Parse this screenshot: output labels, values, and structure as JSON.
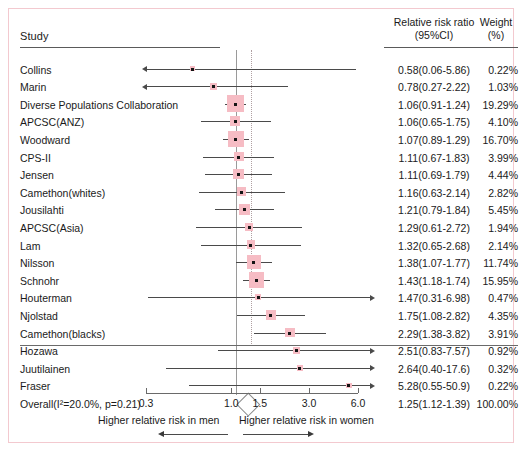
{
  "figure": {
    "type": "forest-plot",
    "columns": {
      "study_header": "Study",
      "effect_header_line1": "Relative risk ratio",
      "effect_header_line2": "(95%CI)",
      "weight_header_line1": "Weight",
      "weight_header_line2": "(%)"
    },
    "axis": {
      "ticks": [
        "0.3",
        "1.0",
        "1.5",
        "3.0",
        "6.0"
      ],
      "tick_values": [
        0.3,
        1.0,
        1.5,
        3.0,
        6.0
      ],
      "caption_left": "Higher relative risk in men",
      "caption_right": "Higher relative risk in women",
      "null_value": 1.0,
      "pooled_line_value": 1.25,
      "scale": "log"
    },
    "colors": {
      "box": "#f6bcc4",
      "frame": "#f3c9cf",
      "line": "#4a4a4a",
      "null_line": "#9a9a9a",
      "pooled_line": "#b0a0a2",
      "text": "#1a1a1a"
    }
  },
  "chart_data": {
    "type": "forest",
    "title": "",
    "xlabel": "Relative risk ratio (95%CI)",
    "ylabel": "Study",
    "xscale": "log",
    "xlim": [
      0.3,
      6.0
    ],
    "xticks": [
      0.3,
      1.0,
      1.5,
      3.0,
      6.0
    ],
    "xticklabels": [
      "0.3",
      "1.0",
      "1.5",
      "3.0",
      "6.0"
    ],
    "null_line": 1.0,
    "pooled_line": 1.25,
    "grid": false,
    "legend": "none",
    "annotations": [
      "Higher relative risk in men",
      "Higher relative risk in women"
    ],
    "columns": [
      "Study",
      "Relative risk ratio (95%CI)",
      "Weight (%)"
    ],
    "rows": [
      {
        "study": "Collins",
        "estimate": 0.58,
        "lower": 0.06,
        "upper": 5.86,
        "effect_text": "0.58(0.06-5.86)",
        "weight": 0.22,
        "weight_text": "0.22%",
        "truncated_left": true,
        "truncated_right": true
      },
      {
        "study": "Marin",
        "estimate": 0.78,
        "lower": 0.27,
        "upper": 2.22,
        "effect_text": "0.78(0.27-2.22)",
        "weight": 1.03,
        "weight_text": "1.03%",
        "truncated_left": true,
        "truncated_right": false
      },
      {
        "study": "Diverse Populations Collaboration",
        "estimate": 1.06,
        "lower": 0.91,
        "upper": 1.24,
        "effect_text": "1.06(0.91-1.24)",
        "weight": 19.29,
        "weight_text": "19.29%",
        "truncated_left": false,
        "truncated_right": false
      },
      {
        "study": "APCSC(ANZ)",
        "estimate": 1.06,
        "lower": 0.65,
        "upper": 1.75,
        "effect_text": "1.06(0.65-1.75)",
        "weight": 4.1,
        "weight_text": "4.10%",
        "truncated_left": false,
        "truncated_right": false
      },
      {
        "study": "Woodward",
        "estimate": 1.07,
        "lower": 0.89,
        "upper": 1.29,
        "effect_text": "1.07(0.89-1.29)",
        "weight": 16.7,
        "weight_text": "16.70%",
        "truncated_left": false,
        "truncated_right": false
      },
      {
        "study": "CPS-II",
        "estimate": 1.11,
        "lower": 0.67,
        "upper": 1.83,
        "effect_text": "1.11(0.67-1.83)",
        "weight": 3.99,
        "weight_text": "3.99%",
        "truncated_left": false,
        "truncated_right": false
      },
      {
        "study": "Jensen",
        "estimate": 1.11,
        "lower": 0.69,
        "upper": 1.79,
        "effect_text": "1.11(0.69-1.79)",
        "weight": 4.44,
        "weight_text": "4.44%",
        "truncated_left": false,
        "truncated_right": false
      },
      {
        "study": "Camethon(whites)",
        "estimate": 1.16,
        "lower": 0.63,
        "upper": 2.14,
        "effect_text": "1.16(0.63-2.14)",
        "weight": 2.82,
        "weight_text": "2.82%",
        "truncated_left": false,
        "truncated_right": false
      },
      {
        "study": "Jousilahti",
        "estimate": 1.21,
        "lower": 0.79,
        "upper": 1.84,
        "effect_text": "1.21(0.79-1.84)",
        "weight": 5.45,
        "weight_text": "5.45%",
        "truncated_left": false,
        "truncated_right": false
      },
      {
        "study": "APCSC(Asia)",
        "estimate": 1.29,
        "lower": 0.61,
        "upper": 2.72,
        "effect_text": "1.29(0.61-2.72)",
        "weight": 1.94,
        "weight_text": "1.94%",
        "truncated_left": false,
        "truncated_right": false
      },
      {
        "study": "Lam",
        "estimate": 1.32,
        "lower": 0.65,
        "upper": 2.68,
        "effect_text": "1.32(0.65-2.68)",
        "weight": 2.14,
        "weight_text": "2.14%",
        "truncated_left": false,
        "truncated_right": false
      },
      {
        "study": "Nilsson",
        "estimate": 1.38,
        "lower": 1.07,
        "upper": 1.77,
        "effect_text": "1.38(1.07-1.77)",
        "weight": 11.74,
        "weight_text": "11.74%",
        "truncated_left": false,
        "truncated_right": false
      },
      {
        "study": "Schnohr",
        "estimate": 1.43,
        "lower": 1.18,
        "upper": 1.74,
        "effect_text": "1.43(1.18-1.74)",
        "weight": 15.95,
        "weight_text": "15.95%",
        "truncated_left": false,
        "truncated_right": false
      },
      {
        "study": "Houterman",
        "estimate": 1.47,
        "lower": 0.31,
        "upper": 6.98,
        "effect_text": "1.47(0.31-6.98)",
        "weight": 0.47,
        "weight_text": "0.47%",
        "truncated_left": false,
        "truncated_right": true
      },
      {
        "study": "Njolstad",
        "estimate": 1.75,
        "lower": 1.08,
        "upper": 2.82,
        "effect_text": "1.75(1.08-2.82)",
        "weight": 4.35,
        "weight_text": "4.35%",
        "truncated_left": false,
        "truncated_right": false
      },
      {
        "study": "Camethon(blacks)",
        "estimate": 2.29,
        "lower": 1.38,
        "upper": 3.82,
        "effect_text": "2.29(1.38-3.82)",
        "weight": 3.91,
        "weight_text": "3.91%",
        "truncated_left": false,
        "truncated_right": false
      },
      {
        "study": "Hozawa",
        "estimate": 2.51,
        "lower": 0.83,
        "upper": 7.57,
        "effect_text": "2.51(0.83-7.57)",
        "weight": 0.92,
        "weight_text": "0.92%",
        "truncated_left": false,
        "truncated_right": true
      },
      {
        "study": "Juutilainen",
        "estimate": 2.64,
        "lower": 0.4,
        "upper": 17.6,
        "effect_text": "2.64(0.40-17.6)",
        "weight": 0.32,
        "weight_text": "0.32%",
        "truncated_left": false,
        "truncated_right": true
      },
      {
        "study": "Fraser",
        "estimate": 5.28,
        "lower": 0.55,
        "upper": 50.9,
        "effect_text": "5.28(0.55-50.9)",
        "weight": 0.22,
        "weight_text": "0.22%",
        "truncated_left": false,
        "truncated_right": true
      }
    ],
    "overall": {
      "study": "Overall(I²=20.0%, p=0.21)",
      "estimate": 1.25,
      "lower": 1.12,
      "upper": 1.39,
      "effect_text": "1.25(1.12-1.39)",
      "weight_text": "100.00%",
      "heterogeneity_i2": "20.0%",
      "heterogeneity_p": "0.21"
    }
  }
}
